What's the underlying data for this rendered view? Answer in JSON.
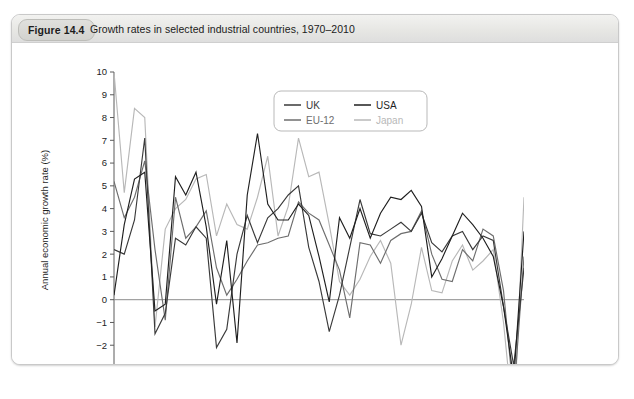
{
  "figure": {
    "badge": "Figure 14.4",
    "caption": "Growth rates in selected industrial countries, 1970–2010"
  },
  "chart_data": {
    "type": "line",
    "title": "Growth rates in selected industrial countries, 1970–2010",
    "xlabel": "",
    "ylabel": "Annual economic growth rate (%)",
    "xlim": [
      1970,
      2010
    ],
    "ylim": [
      -3,
      10
    ],
    "ytick_step": 1,
    "xtick_major_step": 5,
    "xtick_minor_step": 1,
    "grid": false,
    "zero_line": true,
    "legend_position": "top-right-inside",
    "x": [
      1970,
      1971,
      1972,
      1973,
      1974,
      1975,
      1976,
      1977,
      1978,
      1979,
      1980,
      1981,
      1982,
      1983,
      1984,
      1985,
      1986,
      1987,
      1988,
      1989,
      1990,
      1991,
      1992,
      1993,
      1994,
      1995,
      1996,
      1997,
      1998,
      1999,
      2000,
      2001,
      2002,
      2003,
      2004,
      2005,
      2006,
      2007,
      2008,
      2009,
      2010
    ],
    "ytick_labels": [
      "10",
      "9",
      "8",
      "7",
      "6",
      "5",
      "4",
      "3",
      "2",
      "1",
      "0",
      "-1",
      "-2",
      "-3"
    ],
    "xtick_labels": [
      "1970",
      "1975",
      "1980",
      "1985",
      "1990",
      "1995",
      "2000",
      "2005",
      "2010"
    ],
    "series": [
      {
        "name": "UK",
        "color": "#3a3a3a",
        "values": [
          2.2,
          2.0,
          3.5,
          7.1,
          -1.5,
          -0.6,
          2.7,
          2.4,
          3.2,
          2.7,
          -2.1,
          -1.3,
          2.0,
          3.7,
          2.5,
          3.6,
          4.0,
          4.6,
          5.0,
          2.3,
          0.8,
          -1.4,
          0.2,
          2.3,
          4.4,
          2.9,
          2.8,
          3.1,
          3.4,
          3.0,
          3.8,
          2.5,
          2.1,
          2.8,
          3.0,
          2.2,
          2.8,
          2.6,
          -0.3,
          -2.9,
          1.4
        ]
      },
      {
        "name": "USA",
        "color": "#1f1f1f",
        "values": [
          0.2,
          3.3,
          5.3,
          5.6,
          -0.5,
          -0.2,
          5.4,
          4.6,
          5.6,
          3.2,
          -0.2,
          2.6,
          -1.9,
          4.6,
          7.3,
          4.2,
          3.5,
          3.5,
          4.2,
          3.7,
          1.9,
          -0.1,
          3.6,
          2.7,
          4.0,
          2.7,
          3.8,
          4.5,
          4.4,
          4.8,
          4.1,
          1.0,
          1.8,
          2.8,
          3.8,
          3.3,
          2.7,
          1.9,
          -0.3,
          -3.5,
          3.0
        ]
      },
      {
        "name": "EU-12",
        "color": "#6e6e6e",
        "values": [
          5.2,
          3.6,
          4.5,
          6.1,
          2.2,
          -0.9,
          4.5,
          2.7,
          3.2,
          3.9,
          1.4,
          0.2,
          0.9,
          1.7,
          2.4,
          2.5,
          2.7,
          2.8,
          4.3,
          3.8,
          3.5,
          2.4,
          1.3,
          -0.8,
          2.5,
          2.4,
          1.6,
          2.6,
          2.9,
          3.0,
          3.9,
          2.0,
          0.9,
          0.8,
          2.2,
          1.7,
          3.1,
          2.8,
          0.4,
          -4.3,
          1.9
        ]
      },
      {
        "name": "Japan",
        "color": "#b8b8b8",
        "values": [
          10.0,
          4.7,
          8.4,
          8.0,
          -1.2,
          3.1,
          4.0,
          4.4,
          5.3,
          5.5,
          2.8,
          4.2,
          3.3,
          3.1,
          4.5,
          6.3,
          2.8,
          4.1,
          7.1,
          5.4,
          5.6,
          3.3,
          0.8,
          0.2,
          0.9,
          1.9,
          2.6,
          1.6,
          -2.0,
          -0.2,
          2.3,
          0.4,
          0.3,
          1.7,
          2.4,
          1.3,
          1.7,
          2.2,
          -1.0,
          -5.5,
          4.5
        ]
      }
    ]
  },
  "legend": {
    "entries": [
      {
        "label": "UK",
        "color": "#3a3a3a"
      },
      {
        "label": "USA",
        "color": "#1f1f1f"
      },
      {
        "label": "EU-12",
        "color": "#6e6e6e"
      },
      {
        "label": "Japan",
        "color": "#b8b8b8"
      }
    ]
  }
}
